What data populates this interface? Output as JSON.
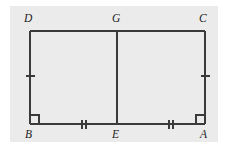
{
  "figure": {
    "type": "geometry-diagram",
    "background_color": "#ffffff",
    "panel_color": "#ebebeb",
    "stroke_color": "#3a3a3a",
    "label_color": "#1c1c1c",
    "panel": {
      "x": 10,
      "y": 6,
      "width": 208,
      "height": 136
    }
  },
  "vertices": [
    {
      "id": "D",
      "label": "D",
      "x": 30,
      "y": 31,
      "label_x": 24,
      "label_y": 13,
      "name": "vertex-label-d"
    },
    {
      "id": "G",
      "label": "G",
      "x": 117,
      "y": 31,
      "label_x": 112,
      "label_y": 13,
      "name": "vertex-label-g"
    },
    {
      "id": "C",
      "label": "C",
      "x": 205,
      "y": 31,
      "label_x": 199,
      "label_y": 13,
      "name": "vertex-label-c"
    },
    {
      "id": "B",
      "label": "B",
      "x": 30,
      "y": 124,
      "label_x": 25,
      "label_y": 129,
      "name": "vertex-label-b"
    },
    {
      "id": "E",
      "label": "E",
      "x": 117,
      "y": 124,
      "label_x": 112,
      "label_y": 129,
      "name": "vertex-label-e"
    },
    {
      "id": "A",
      "label": "A",
      "x": 205,
      "y": 124,
      "label_x": 200,
      "label_y": 129,
      "name": "vertex-label-a"
    }
  ],
  "segments": [
    {
      "id": "DC",
      "from": "D",
      "to": "C",
      "x1": 30,
      "y1": 31,
      "x2": 205,
      "y2": 31,
      "name": "segment-dc"
    },
    {
      "id": "BA",
      "from": "B",
      "to": "A",
      "x1": 30,
      "y1": 124,
      "x2": 205,
      "y2": 124,
      "name": "segment-ba"
    },
    {
      "id": "DB",
      "from": "D",
      "to": "B",
      "x1": 30,
      "y1": 31,
      "x2": 30,
      "y2": 124,
      "name": "segment-db"
    },
    {
      "id": "CA",
      "from": "C",
      "to": "A",
      "x1": 205,
      "y1": 31,
      "x2": 205,
      "y2": 124,
      "name": "segment-ca"
    },
    {
      "id": "GE",
      "from": "G",
      "to": "E",
      "x1": 117,
      "y1": 31,
      "x2": 117,
      "y2": 124,
      "name": "segment-ge"
    }
  ],
  "tick_marks": [
    {
      "on_segment": "DB",
      "count": 1,
      "orientation": "horizontal",
      "cx": 30,
      "cy": 76,
      "length": 9,
      "name": "tick-mark-db"
    },
    {
      "on_segment": "CA",
      "count": 1,
      "orientation": "horizontal",
      "cx": 205,
      "cy": 76,
      "length": 9,
      "name": "tick-mark-ca"
    },
    {
      "on_segment": "BE",
      "count": 2,
      "orientation": "vertical",
      "cx": 84,
      "cy": 124,
      "length": 9,
      "gap": 4,
      "name": "tick-mark-be"
    },
    {
      "on_segment": "EA",
      "count": 2,
      "orientation": "vertical",
      "cx": 171,
      "cy": 124,
      "length": 9,
      "gap": 4,
      "name": "tick-mark-ea"
    }
  ],
  "right_angle_markers": [
    {
      "at_vertex": "B",
      "x": 30,
      "y": 124,
      "size": 9,
      "dir_x": 1,
      "dir_y": -1,
      "name": "right-angle-marker-b"
    },
    {
      "at_vertex": "A",
      "x": 205,
      "y": 124,
      "size": 9,
      "dir_x": -1,
      "dir_y": -1,
      "name": "right-angle-marker-a"
    }
  ]
}
